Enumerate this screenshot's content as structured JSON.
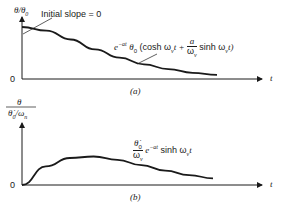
{
  "panel_a": {
    "y_label": "θ/θ₀",
    "y_label_main": "θ/θ",
    "y_label_sub": "0",
    "annotation": "Initial slope = 0",
    "origin": "0",
    "x_label": "t",
    "caption": "(a)",
    "curve_label": {
      "prefix": "e",
      "exp": "−at",
      "theta": "θ",
      "theta_sub": "0",
      "open": "(cosh ω",
      "w_sub": "v",
      "t1": "t +",
      "frac_num": "a",
      "frac_den": "ω",
      "frac_den_sub": "v",
      "sinh": "sinh ω",
      "sinh_sub": "v",
      "close": "t)"
    }
  },
  "panel_b": {
    "y_label_num": "θ",
    "y_label_den": "θ̇₀/ω",
    "y_label_den_main": "θ̇",
    "y_label_den_sub": "0",
    "y_label_den_rest": "/ω",
    "y_label_den_rest_sub": "n",
    "origin": "0",
    "x_label": "t",
    "caption": "(b)",
    "curve_label": {
      "frac_num": "θ̇",
      "frac_num_sub": "0",
      "frac_den": "ω",
      "frac_den_sub": "v",
      "prefix": "e",
      "exp": "−at",
      "sinh": "sinh ω",
      "sinh_sub": "v",
      "tail": "t"
    }
  },
  "chart_data": [
    {
      "type": "line",
      "title": "(a)",
      "xlabel": "t",
      "ylabel": "θ/θ0",
      "series": [
        {
          "name": "e^{-at} θ0 (cosh ωv t + a/ωv sinh ωv t)",
          "x": [
            0,
            1,
            2,
            3,
            4,
            5,
            6,
            7,
            8
          ],
          "y": [
            1.0,
            0.93,
            0.76,
            0.57,
            0.41,
            0.28,
            0.19,
            0.12,
            0.08
          ]
        }
      ],
      "annotations": [
        "Initial slope = 0"
      ],
      "ylim": [
        0,
        1.2
      ]
    },
    {
      "type": "line",
      "title": "(b)",
      "xlabel": "t",
      "ylabel": "θ/(θ̇0/ωn)",
      "series": [
        {
          "name": "θ̇0/ωv e^{-at} sinh ωv t",
          "x": [
            0,
            1,
            2,
            3,
            4,
            5,
            6,
            7,
            8
          ],
          "y": [
            0,
            0.62,
            0.9,
            0.95,
            0.84,
            0.66,
            0.48,
            0.33,
            0.22
          ]
        }
      ],
      "ylim": [
        0,
        1.6
      ]
    }
  ]
}
